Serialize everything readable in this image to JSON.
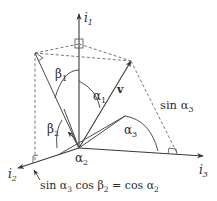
{
  "figure": {
    "axes": {
      "i1": {
        "label": "i",
        "subscript": "1"
      },
      "i2": {
        "label": "i",
        "subscript": "2"
      },
      "i3": {
        "label": "i",
        "subscript": "3"
      }
    },
    "vector": {
      "label": "v"
    },
    "angles": {
      "alpha1": {
        "symbol": "α",
        "subscript": "1"
      },
      "alpha2": {
        "symbol": "α",
        "subscript": "2"
      },
      "alpha3": {
        "symbol": "α",
        "subscript": "3"
      },
      "beta1": {
        "symbol": "β",
        "subscript": "1"
      },
      "beta2": {
        "symbol": "β",
        "subscript": "2"
      }
    },
    "annotations": {
      "sin_alpha3": {
        "prefix": "sin α",
        "subscript": "3"
      },
      "identity": {
        "part1": "sin α",
        "sub1": "3",
        "part2": " cos β",
        "sub2": "2",
        "part3": " = cos α",
        "sub3": "2"
      }
    },
    "colors": {
      "line": "#4a4a4a",
      "dashed": "#777777",
      "text": "#2b2b2b",
      "background": "#ffffff"
    }
  }
}
